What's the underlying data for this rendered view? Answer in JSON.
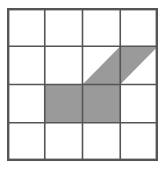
{
  "figure": {
    "type": "grid-shaded-polygon",
    "title": "",
    "grid": {
      "rows": 4,
      "columns": 4,
      "origin_x": 7,
      "origin_y": 8,
      "width": 151,
      "height": 153,
      "cell_width": 37.75,
      "cell_height": 38.25,
      "line_color": "#555555",
      "inner_line_width": 1.6,
      "outer_line_width": 2.4,
      "background_color": "#ffffff"
    },
    "shading": {
      "fill_color": "#9a9a9a",
      "fill_opacity": 1,
      "shaded_area_cells": 3,
      "total_cells": 16
    },
    "shaded_parts": [
      {
        "id": "cell-r3-c2",
        "name": "full-square",
        "row": 3,
        "column": 2,
        "shape": "square",
        "fraction": 1,
        "points": "37.75,76.5 75.5,76.5 75.5,114.75 37.75,114.75"
      },
      {
        "id": "cell-r3-c3",
        "name": "full-square",
        "row": 3,
        "column": 3,
        "shape": "square",
        "fraction": 1,
        "points": "75.5,76.5 113.25,76.5 113.25,114.75 75.5,114.75"
      },
      {
        "id": "cell-r2-c3",
        "name": "lower-right-triangle",
        "row": 2,
        "column": 3,
        "shape": "triangle",
        "fraction": 0.5,
        "points": "75.5,76.5 113.25,38.25 113.25,76.5"
      },
      {
        "id": "cell-r2-c4",
        "name": "upper-left-triangle",
        "row": 2,
        "column": 4,
        "shape": "triangle",
        "fraction": 0.5,
        "points": "113.25,38.25 151,38.25 113.25,76.5"
      }
    ],
    "vertical_lines": [
      {
        "x": 0
      },
      {
        "x": 37.75
      },
      {
        "x": 75.5
      },
      {
        "x": 113.25
      },
      {
        "x": 151
      }
    ],
    "horizontal_lines": [
      {
        "y": 0
      },
      {
        "y": 38.25
      },
      {
        "y": 76.5
      },
      {
        "y": 114.75
      },
      {
        "y": 153
      }
    ]
  }
}
